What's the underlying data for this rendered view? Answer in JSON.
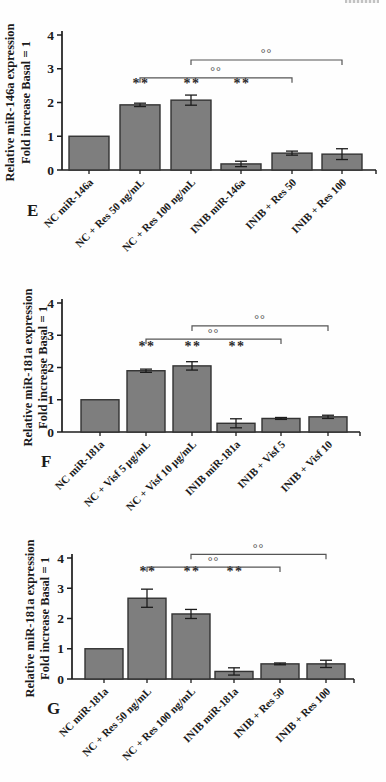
{
  "figure_title": "",
  "colors": {
    "bar_fill": "#7e7e7e",
    "bar_border": "#333333",
    "axis": "#1c1c1c",
    "error_bar": "#1c1c1c",
    "bracket": "#555555",
    "text": "#1b1b1b",
    "background": "#fefefe"
  },
  "chart_data": [
    {
      "type": "bar",
      "panel_label": "E",
      "ylabel_line1": "Relative miR-146a expression",
      "ylabel_line2": "Fold increase Basal = 1",
      "xlabel": "",
      "ylim": [
        0,
        4
      ],
      "yticks": [
        0,
        1,
        2,
        3,
        4
      ],
      "grid": false,
      "legend": "none",
      "categories": [
        "NC miR-146a",
        "NC + Res 50 ng/mL",
        "NC + Res 100 ng/mL",
        "INIB miR-146a",
        "INIB + Res 50",
        "INIB + Res 100"
      ],
      "values": [
        1.0,
        1.93,
        2.07,
        0.18,
        0.5,
        0.47
      ],
      "errors": [
        0,
        0.05,
        0.15,
        0.08,
        0.06,
        0.16
      ],
      "significance_markers": [
        {
          "bar_index": 1,
          "label": "**",
          "level": 2.44
        },
        {
          "bar_index": 2,
          "label": "**",
          "level": 2.44
        },
        {
          "bar_index": 3,
          "label": "**",
          "level": 2.44
        }
      ],
      "comparison_brackets": [
        {
          "from_index": 1,
          "to_index": 4,
          "label": "°°",
          "level": 2.73
        },
        {
          "from_index": 2,
          "to_index": 5,
          "label": "°°",
          "level": 3.26
        }
      ]
    },
    {
      "type": "bar",
      "panel_label": "F",
      "ylabel_line1": "Relative miR-181a expression",
      "ylabel_line2": "Fold increase Basal = 1",
      "xlabel": "",
      "ylim": [
        0,
        4
      ],
      "yticks": [
        0,
        1,
        2,
        3,
        4
      ],
      "grid": false,
      "legend": "none",
      "categories": [
        "NC miR-181a",
        "NC + Visf 5 µg/mL",
        "NC + Visf 10 µg/mL",
        "INIB miR-181a",
        "INIB + Visf 5",
        "INIB + Visf 10"
      ],
      "values": [
        1.0,
        1.9,
        2.05,
        0.27,
        0.42,
        0.47
      ],
      "errors": [
        0,
        0.05,
        0.13,
        0.14,
        0.03,
        0.05
      ],
      "significance_markers": [
        {
          "bar_index": 1,
          "label": "**",
          "level": 2.51
        },
        {
          "bar_index": 2,
          "label": "**",
          "level": 2.51
        },
        {
          "bar_index": 3,
          "label": "**",
          "level": 2.51
        }
      ],
      "comparison_brackets": [
        {
          "from_index": 1,
          "to_index": 4,
          "label": "°°",
          "level": 2.88
        },
        {
          "from_index": 2,
          "to_index": 5,
          "label": "°°",
          "level": 3.29
        }
      ]
    },
    {
      "type": "bar",
      "panel_label": "G",
      "ylabel_line1": "Relative miR-181a expression",
      "ylabel_line2": "Fold increase Basal = 1",
      "xlabel": "",
      "ylim": [
        0,
        4
      ],
      "yticks": [
        0,
        1,
        2,
        3,
        4
      ],
      "grid": false,
      "legend": "none",
      "categories": [
        "NC miR-181a",
        "NC + Res 50 ng/mL",
        "NC + Res 100 ng/mL",
        "INIB miR-181a",
        "INIB + Res 50",
        "INIB + Res 100"
      ],
      "values": [
        1.0,
        2.67,
        2.15,
        0.25,
        0.5,
        0.5
      ],
      "errors": [
        0,
        0.3,
        0.15,
        0.12,
        0.03,
        0.12
      ],
      "significance_markers": [
        {
          "bar_index": 1,
          "label": "**",
          "level": 3.4
        },
        {
          "bar_index": 2,
          "label": "**",
          "level": 3.4
        },
        {
          "bar_index": 3,
          "label": "**",
          "level": 3.4
        }
      ],
      "comparison_brackets": [
        {
          "from_index": 1,
          "to_index": 4,
          "label": "°°",
          "level": 3.7
        },
        {
          "from_index": 2,
          "to_index": 5,
          "label": "°°",
          "level": 4.12
        }
      ]
    }
  ]
}
